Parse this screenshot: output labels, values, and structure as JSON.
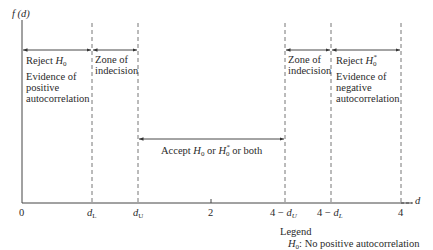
{
  "diagram": {
    "type": "durbin-watson-decision-regions",
    "y_axis_label": "f (d)",
    "x_axis_label": "d",
    "ticks": [
      {
        "id": "zero",
        "label": "0"
      },
      {
        "id": "dL",
        "label": "d",
        "sub": "L"
      },
      {
        "id": "dU",
        "label": "d",
        "sub": "U"
      },
      {
        "id": "two",
        "label": "2"
      },
      {
        "id": "four_minus_dU",
        "prefix": "4 − ",
        "label": "d",
        "sub": "U"
      },
      {
        "id": "four_minus_dL",
        "prefix": "4 − ",
        "label": "d",
        "sub": "L"
      },
      {
        "id": "four",
        "label": "4"
      }
    ],
    "regions": {
      "reject_h0": {
        "title_prefix": "Reject ",
        "symbol": "H",
        "sub": "0",
        "line1": "Evidence of",
        "line2": "positive",
        "line3": "autocorrelation"
      },
      "indecision_left": {
        "line1": "Zone of",
        "line2": "indecision"
      },
      "accept": {
        "prefix": "Accept ",
        "h0": "H",
        "h0_sub": "0",
        "mid": " or ",
        "h0star": "H",
        "h0star_sub": "0",
        "star": "*",
        "suffix": " or both"
      },
      "indecision_right": {
        "line1": "Zone of",
        "line2": "indecision"
      },
      "reject_h0_star": {
        "title_prefix": "Reject ",
        "symbol": "H",
        "sub": "0",
        "star": "*",
        "line1": "Evidence of",
        "line2": "negative",
        "line3": "autocorrelation"
      }
    },
    "legend": {
      "title": "Legend",
      "entry_symbol": "H",
      "entry_sub": "0",
      "entry_text": ":  No positive autocorrelation"
    }
  }
}
